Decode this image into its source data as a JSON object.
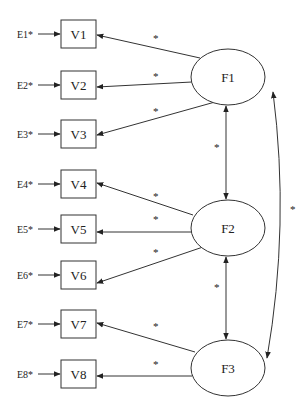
{
  "diagram": {
    "type": "structural-equation-model",
    "colors": {
      "stroke": "#333333",
      "text": "#222222",
      "background": "#ffffff"
    },
    "observed": [
      {
        "id": "V1",
        "label": "V1",
        "error": "E1*"
      },
      {
        "id": "V2",
        "label": "V2",
        "error": "E2*"
      },
      {
        "id": "V3",
        "label": "V3",
        "error": "E3*"
      },
      {
        "id": "V4",
        "label": "V4",
        "error": "E4*"
      },
      {
        "id": "V5",
        "label": "V5",
        "error": "E5*"
      },
      {
        "id": "V6",
        "label": "V6",
        "error": "E6*"
      },
      {
        "id": "V7",
        "label": "V7",
        "error": "E7*"
      },
      {
        "id": "V8",
        "label": "V8",
        "error": "E8*"
      }
    ],
    "latent": [
      {
        "id": "F1",
        "label": "F1"
      },
      {
        "id": "F2",
        "label": "F2"
      },
      {
        "id": "F3",
        "label": "F3"
      }
    ],
    "loadings": [
      {
        "from": "F1",
        "to": "V1",
        "label": "*"
      },
      {
        "from": "F1",
        "to": "V2",
        "label": "*"
      },
      {
        "from": "F1",
        "to": "V3",
        "label": "*"
      },
      {
        "from": "F2",
        "to": "V4",
        "label": "*"
      },
      {
        "from": "F2",
        "to": "V5",
        "label": "*"
      },
      {
        "from": "F2",
        "to": "V6",
        "label": "*"
      },
      {
        "from": "F3",
        "to": "V7",
        "label": "*"
      },
      {
        "from": "F3",
        "to": "V8",
        "label": "*"
      }
    ],
    "covariances": [
      {
        "between": [
          "F1",
          "F2"
        ],
        "label": "*"
      },
      {
        "between": [
          "F2",
          "F3"
        ],
        "label": "*"
      },
      {
        "between": [
          "F1",
          "F3"
        ],
        "label": "*"
      }
    ]
  }
}
